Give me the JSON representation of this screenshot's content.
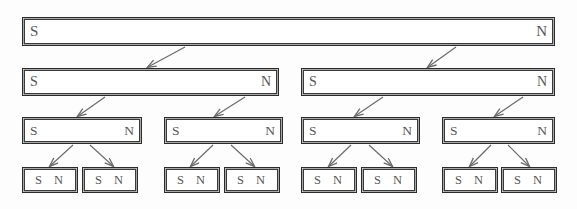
{
  "figure": {
    "background_color": "#fdfdfd",
    "box_fill": "#ffffff",
    "box_border_color": "#2b2b2b",
    "arrow_color": "#6b6b6b",
    "label_color": "#555555"
  },
  "labels": {
    "south": "S",
    "north": "N"
  },
  "levels": [
    {
      "level": 1,
      "count": 1,
      "boxes": [
        {
          "id": "magnet-l1-1",
          "south": "S",
          "north": "N",
          "x": 24,
          "y": 19,
          "w": 529,
          "h": 25
        }
      ]
    },
    {
      "level": 2,
      "count": 2,
      "boxes": [
        {
          "id": "magnet-l2-1",
          "south": "S",
          "north": "N",
          "x": 24,
          "y": 70,
          "w": 253,
          "h": 24
        },
        {
          "id": "magnet-l2-2",
          "south": "S",
          "north": "N",
          "x": 303,
          "y": 70,
          "w": 250,
          "h": 24
        }
      ]
    },
    {
      "level": 3,
      "count": 4,
      "boxes": [
        {
          "id": "magnet-l3-1",
          "south": "S",
          "north": "N",
          "x": 24,
          "y": 119,
          "w": 116,
          "h": 23
        },
        {
          "id": "magnet-l3-2",
          "south": "S",
          "north": "N",
          "x": 166,
          "y": 119,
          "w": 115,
          "h": 23
        },
        {
          "id": "magnet-l3-3",
          "south": "S",
          "north": "N",
          "x": 303,
          "y": 119,
          "w": 115,
          "h": 23
        },
        {
          "id": "magnet-l3-4",
          "south": "S",
          "north": "N",
          "x": 444,
          "y": 119,
          "w": 109,
          "h": 23
        }
      ]
    },
    {
      "level": 4,
      "count": 8,
      "boxes": [
        {
          "id": "magnet-l4-1",
          "south": "S",
          "north": "N",
          "x": 24,
          "y": 169,
          "w": 52,
          "h": 22
        },
        {
          "id": "magnet-l4-2",
          "south": "S",
          "north": "N",
          "x": 84,
          "y": 169,
          "w": 52,
          "h": 22
        },
        {
          "id": "magnet-l4-3",
          "south": "S",
          "north": "N",
          "x": 166,
          "y": 169,
          "w": 52,
          "h": 22
        },
        {
          "id": "magnet-l4-4",
          "south": "S",
          "north": "N",
          "x": 226,
          "y": 169,
          "w": 52,
          "h": 22
        },
        {
          "id": "magnet-l4-5",
          "south": "S",
          "north": "N",
          "x": 303,
          "y": 169,
          "w": 52,
          "h": 22
        },
        {
          "id": "magnet-l4-6",
          "south": "S",
          "north": "N",
          "x": 363,
          "y": 169,
          "w": 52,
          "h": 22
        },
        {
          "id": "magnet-l4-7",
          "south": "S",
          "north": "N",
          "x": 444,
          "y": 169,
          "w": 52,
          "h": 22
        },
        {
          "id": "magnet-l4-8",
          "south": "S",
          "north": "N",
          "x": 503,
          "y": 169,
          "w": 52,
          "h": 22
        }
      ]
    }
  ],
  "arrows": [
    {
      "id": "arrow-l1-to-l2-1",
      "x1": 185,
      "y1": 47,
      "x2": 148,
      "y2": 67
    },
    {
      "id": "arrow-l1-to-l2-2",
      "x1": 456,
      "y1": 47,
      "x2": 428,
      "y2": 67
    },
    {
      "id": "arrow-l2-to-l3-1",
      "x1": 105,
      "y1": 97,
      "x2": 78,
      "y2": 116
    },
    {
      "id": "arrow-l2-to-l3-2",
      "x1": 245,
      "y1": 97,
      "x2": 215,
      "y2": 116
    },
    {
      "id": "arrow-l2-to-l3-3",
      "x1": 383,
      "y1": 97,
      "x2": 355,
      "y2": 116
    },
    {
      "id": "arrow-l2-to-l3-4",
      "x1": 523,
      "y1": 97,
      "x2": 495,
      "y2": 116
    },
    {
      "id": "arrow-l3-to-l4-1",
      "x1": 73,
      "y1": 145,
      "x2": 50,
      "y2": 166
    },
    {
      "id": "arrow-l3-to-l4-2",
      "x1": 90,
      "y1": 145,
      "x2": 113,
      "y2": 166
    },
    {
      "id": "arrow-l3-to-l4-3",
      "x1": 213,
      "y1": 145,
      "x2": 191,
      "y2": 166
    },
    {
      "id": "arrow-l3-to-l4-4",
      "x1": 231,
      "y1": 145,
      "x2": 254,
      "y2": 166
    },
    {
      "id": "arrow-l3-to-l4-5",
      "x1": 351,
      "y1": 145,
      "x2": 329,
      "y2": 166
    },
    {
      "id": "arrow-l3-to-l4-6",
      "x1": 369,
      "y1": 145,
      "x2": 392,
      "y2": 166
    },
    {
      "id": "arrow-l3-to-l4-7",
      "x1": 491,
      "y1": 145,
      "x2": 470,
      "y2": 166
    },
    {
      "id": "arrow-l3-to-l4-8",
      "x1": 508,
      "y1": 145,
      "x2": 529,
      "y2": 166
    }
  ]
}
